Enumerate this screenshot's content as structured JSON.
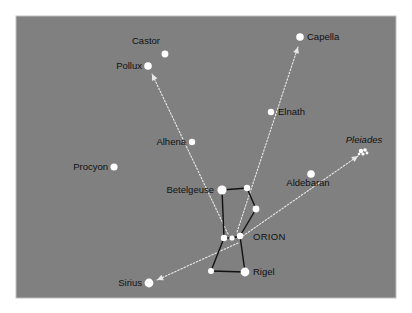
{
  "chart_data": {
    "type": "scatter",
    "title": "",
    "subtitle": "",
    "xlabel": "",
    "ylabel": "",
    "panel": {
      "background_color": "#808080",
      "border_color": "#bfbfbf",
      "x": 16,
      "y": 16,
      "width": 380,
      "height": 282
    },
    "page_background": "#ffffff",
    "star_color": "#ffffff",
    "line_color": "#111111",
    "pointer_color": "#e8e8e8",
    "label_color": "#111111",
    "stars": [
      {
        "name": "Castor",
        "label": "Castor",
        "x": 165,
        "y": 54,
        "r": 3.4,
        "label_x": 146,
        "label_y": 44,
        "anchor": "middle",
        "style": "normal"
      },
      {
        "name": "Pollux",
        "label": "Pollux",
        "x": 148,
        "y": 66,
        "r": 3.8,
        "label_x": 142,
        "label_y": 69,
        "anchor": "end",
        "style": "normal"
      },
      {
        "name": "Capella",
        "label": "Capella",
        "x": 300,
        "y": 37,
        "r": 3.8,
        "label_x": 307,
        "label_y": 40,
        "anchor": "start",
        "style": "normal"
      },
      {
        "name": "Elnath",
        "label": "Elnath",
        "x": 271,
        "y": 112,
        "r": 3.2,
        "label_x": 278,
        "label_y": 115,
        "anchor": "start",
        "style": "normal"
      },
      {
        "name": "Alhena",
        "label": "Alhena",
        "x": 192,
        "y": 142,
        "r": 3.2,
        "label_x": 186,
        "label_y": 145,
        "anchor": "end",
        "style": "normal"
      },
      {
        "name": "Pleiades",
        "label": "Pleiades",
        "x": 363,
        "y": 152,
        "r": 0,
        "label_x": 364,
        "label_y": 143,
        "anchor": "middle",
        "style": "italic"
      },
      {
        "name": "Procyon",
        "label": "Procyon",
        "x": 114,
        "y": 167,
        "r": 3.6,
        "label_x": 108,
        "label_y": 170,
        "anchor": "end",
        "style": "normal"
      },
      {
        "name": "Aldebaran",
        "label": "Aldebaran",
        "x": 311,
        "y": 174,
        "r": 3.8,
        "label_x": 308,
        "label_y": 186,
        "anchor": "middle",
        "style": "normal"
      },
      {
        "name": "Betelgeuse",
        "label": "Betelgeuse",
        "x": 222,
        "y": 190,
        "r": 4.6,
        "label_x": 214,
        "label_y": 193,
        "anchor": "end",
        "style": "normal"
      },
      {
        "name": "Meissa",
        "label": "",
        "x": 247,
        "y": 188,
        "r": 3.2,
        "label_x": 0,
        "label_y": 0,
        "anchor": "middle",
        "style": "normal"
      },
      {
        "name": "Bellatrix",
        "label": "",
        "x": 256,
        "y": 209,
        "r": 3.4,
        "label_x": 0,
        "label_y": 0,
        "anchor": "middle",
        "style": "normal"
      },
      {
        "name": "Alnitak",
        "label": "",
        "x": 224,
        "y": 238,
        "r": 3.2,
        "label_x": 0,
        "label_y": 0,
        "anchor": "middle",
        "style": "normal"
      },
      {
        "name": "Alnilam",
        "label": "",
        "x": 232,
        "y": 238,
        "r": 2.6,
        "label_x": 0,
        "label_y": 0,
        "anchor": "middle",
        "style": "normal"
      },
      {
        "name": "Mintaka",
        "label": "",
        "x": 240,
        "y": 236,
        "r": 3.2,
        "label_x": 0,
        "label_y": 0,
        "anchor": "middle",
        "style": "normal"
      },
      {
        "name": "Saiph",
        "label": "",
        "x": 211,
        "y": 271,
        "r": 3.0,
        "label_x": 0,
        "label_y": 0,
        "anchor": "middle",
        "style": "normal"
      },
      {
        "name": "Rigel",
        "label": "Rigel",
        "x": 245,
        "y": 272,
        "r": 4.4,
        "label_x": 253,
        "label_y": 275,
        "anchor": "start",
        "style": "normal"
      },
      {
        "name": "Sirius",
        "label": "Sirius",
        "x": 149,
        "y": 283,
        "r": 4.4,
        "label_x": 142,
        "label_y": 286,
        "anchor": "end",
        "style": "normal"
      }
    ],
    "pleiades_cluster": [
      {
        "x": 361,
        "y": 151,
        "r": 2.2
      },
      {
        "x": 365,
        "y": 150,
        "r": 1.8
      },
      {
        "x": 363,
        "y": 154,
        "r": 1.6
      },
      {
        "x": 367,
        "y": 153,
        "r": 1.4
      },
      {
        "x": 359,
        "y": 154,
        "r": 1.3
      }
    ],
    "constellation_lines": [
      {
        "name": "betelgeuse-meissa",
        "x1": 222,
        "y1": 190,
        "x2": 247,
        "y2": 188
      },
      {
        "name": "meissa-bellatrix",
        "x1": 247,
        "y1": 188,
        "x2": 256,
        "y2": 209
      },
      {
        "name": "bellatrix-mintaka",
        "x1": 256,
        "y1": 209,
        "x2": 240,
        "y2": 236
      },
      {
        "name": "betelgeuse-alnitak",
        "x1": 222,
        "y1": 190,
        "x2": 224,
        "y2": 238
      },
      {
        "name": "belt-alnitak-alnilam",
        "x1": 224,
        "y1": 238,
        "x2": 232,
        "y2": 238
      },
      {
        "name": "belt-alnilam-mintaka",
        "x1": 232,
        "y1": 238,
        "x2": 240,
        "y2": 236
      },
      {
        "name": "alnitak-saiph",
        "x1": 224,
        "y1": 238,
        "x2": 211,
        "y2": 271
      },
      {
        "name": "mintaka-rigel",
        "x1": 240,
        "y1": 236,
        "x2": 245,
        "y2": 272
      },
      {
        "name": "saiph-rigel",
        "x1": 211,
        "y1": 271,
        "x2": 245,
        "y2": 272
      }
    ],
    "pointer_lines": [
      {
        "name": "pointer-to-pollux",
        "x1": 228,
        "y1": 234,
        "x2": 152,
        "y2": 74,
        "from": "belt",
        "to": "Pollux"
      },
      {
        "name": "pointer-to-capella",
        "x1": 237,
        "y1": 232,
        "x2": 298,
        "y2": 47,
        "from": "belt",
        "to": "Capella"
      },
      {
        "name": "pointer-to-aldebaran",
        "x1": 240,
        "y1": 238,
        "x2": 358,
        "y2": 156,
        "from": "belt",
        "to": "Pleiades"
      },
      {
        "name": "pointer-to-sirius",
        "x1": 238,
        "y1": 243,
        "x2": 157,
        "y2": 280,
        "from": "belt",
        "to": "Sirius"
      }
    ]
  }
}
